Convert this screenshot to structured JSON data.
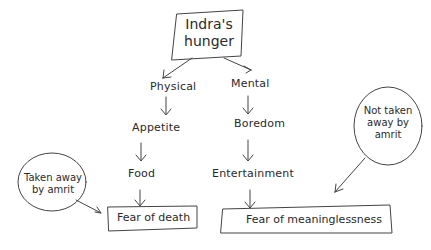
{
  "diagram": {
    "root": {
      "line1": "Indra's",
      "line2": "hunger"
    },
    "branches": [
      {
        "label": "Physical",
        "chain": [
          "Appetite",
          "Food"
        ],
        "outcome": "Fear of death"
      },
      {
        "label": "Mental",
        "chain": [
          "Boredom",
          "Entertainment"
        ],
        "outcome": "Fear of meaninglessness"
      }
    ],
    "annotations": [
      {
        "line1": "Taken away",
        "line2": "by amrit",
        "target": "Fear of death"
      },
      {
        "line1": "Not taken",
        "line2": "away by",
        "line3": "amrit",
        "target": "Fear of meaninglessness"
      }
    ]
  }
}
